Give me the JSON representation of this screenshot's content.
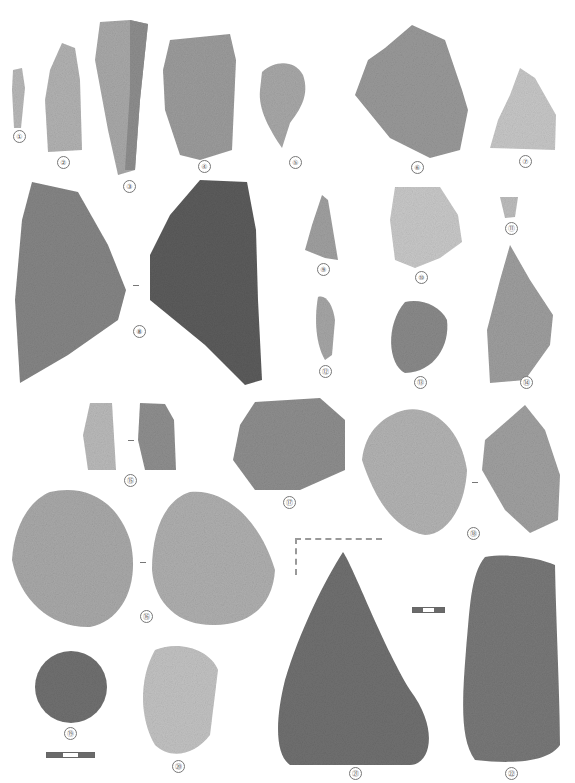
{
  "plate": {
    "background": "#ffffff",
    "artifacts": [
      {
        "id": 1,
        "label": "①"
      },
      {
        "id": 2,
        "label": "②"
      },
      {
        "id": 3,
        "label": "③"
      },
      {
        "id": 4,
        "label": "④"
      },
      {
        "id": 5,
        "label": "⑤"
      },
      {
        "id": 6,
        "label": "⑥"
      },
      {
        "id": 7,
        "label": "⑦"
      },
      {
        "id": 8,
        "label": "⑧"
      },
      {
        "id": 9,
        "label": "⑨"
      },
      {
        "id": 10,
        "label": "⑩"
      },
      {
        "id": 11,
        "label": "⑪"
      },
      {
        "id": 12,
        "label": "⑫"
      },
      {
        "id": 13,
        "label": "⑬"
      },
      {
        "id": 14,
        "label": "⑭"
      },
      {
        "id": 15,
        "label": "⑮"
      },
      {
        "id": 16,
        "label": "⑯"
      },
      {
        "id": 17,
        "label": "⑰"
      },
      {
        "id": 18,
        "label": "⑱"
      },
      {
        "id": 19,
        "label": "⑲"
      },
      {
        "id": 20,
        "label": "⑳"
      },
      {
        "id": 21,
        "label": "㉑"
      },
      {
        "id": 22,
        "label": "㉒"
      }
    ],
    "scale_bars": [
      {
        "name": "scale-bar-small-finds",
        "segments": [
          "dark",
          "light",
          "dark"
        ]
      },
      {
        "name": "scale-bar-large-finds",
        "segments": [
          "dark",
          "light",
          "dark"
        ]
      }
    ]
  }
}
